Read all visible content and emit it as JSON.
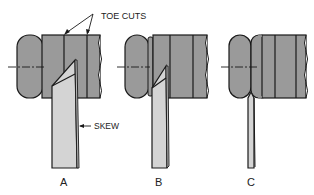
{
  "figure": {
    "annotations": {
      "toe_cuts": "TOE CUTS",
      "skew": "SKEW"
    },
    "panels": [
      {
        "label": "A"
      },
      {
        "label": "B"
      },
      {
        "label": "C"
      }
    ]
  },
  "colors": {
    "workpiece": "#9a9a9a",
    "tool": "#d4d4d4",
    "outline": "#1a1a1a",
    "background": "#ffffff"
  }
}
